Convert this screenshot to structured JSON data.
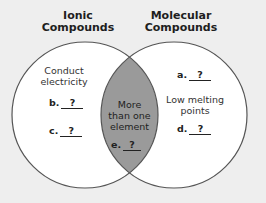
{
  "diagram": {
    "type": "venn",
    "background_color": "#eeeeee",
    "circle_fill": "#ffffff",
    "overlap_fill": "#9a9a9a",
    "stroke_color": "#555555",
    "sets": [
      {
        "title_line1": "Ionic",
        "title_line2": "Compounds",
        "items": [
          {
            "type": "text",
            "line1": "Conduct",
            "line2": "electricity"
          },
          {
            "type": "blank",
            "letter": "b.",
            "value": "?"
          },
          {
            "type": "blank",
            "letter": "c.",
            "value": "?"
          }
        ]
      },
      {
        "title_line1": "Molecular",
        "title_line2": "Compounds",
        "items": [
          {
            "type": "blank",
            "letter": "a.",
            "value": "?"
          },
          {
            "type": "text",
            "line1": "Low melting",
            "line2": "points"
          },
          {
            "type": "blank",
            "letter": "d.",
            "value": "?"
          }
        ]
      }
    ],
    "overlap": {
      "line1": "More",
      "line2": "than one",
      "line3": "element",
      "blank": {
        "letter": "e.",
        "value": "?"
      }
    }
  }
}
